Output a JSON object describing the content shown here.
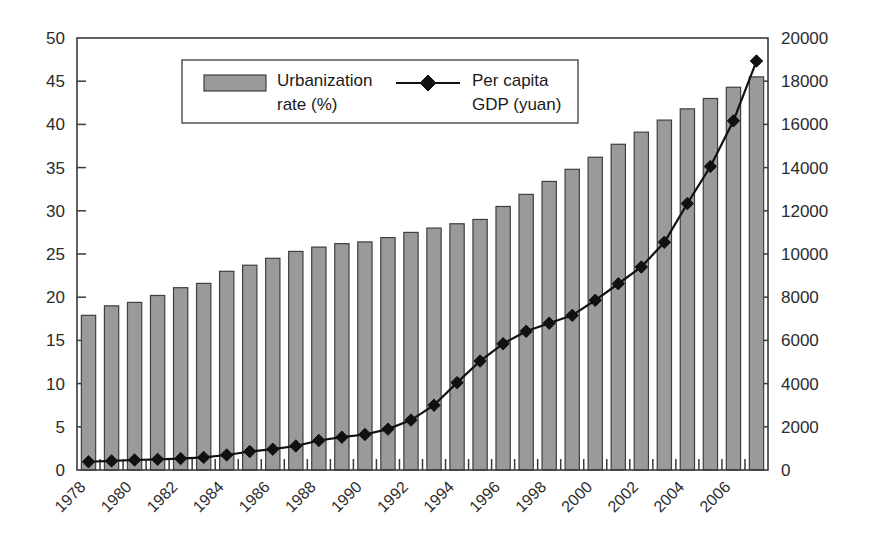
{
  "chart_data": {
    "type": "bar",
    "title": "",
    "subtitle": "",
    "xlabel": "",
    "ylabel": "",
    "grid": false,
    "legend_position": "top-center-inside",
    "categories": [
      "1978",
      "1979",
      "1980",
      "1981",
      "1982",
      "1983",
      "1984",
      "1985",
      "1986",
      "1987",
      "1988",
      "1989",
      "1990",
      "1991",
      "1992",
      "1993",
      "1994",
      "1995",
      "1996",
      "1997",
      "1998",
      "1999",
      "2000",
      "2001",
      "2002",
      "2003",
      "2004",
      "2005",
      "2006",
      "2007"
    ],
    "x_tick_labels": [
      "1978",
      "1980",
      "1982",
      "1984",
      "1986",
      "1988",
      "1990",
      "1992",
      "1994",
      "1996",
      "1998",
      "2000",
      "2002",
      "2004",
      "2006"
    ],
    "x_tick_rotation_degrees": 45,
    "left_axis": {
      "label": "Urbanization rate (%)",
      "ylim": [
        0,
        50
      ],
      "tick_step": 5,
      "ticks": [
        0,
        5,
        10,
        15,
        20,
        25,
        30,
        35,
        40,
        45,
        50
      ]
    },
    "right_axis": {
      "label": "Per capita GDP (yuan)",
      "ylim": [
        0,
        20000
      ],
      "tick_step": 2000,
      "ticks": [
        0,
        2000,
        4000,
        6000,
        8000,
        10000,
        12000,
        14000,
        16000,
        18000,
        20000
      ]
    },
    "series": [
      {
        "name": "Urbanization rate (%)",
        "type": "bar",
        "axis": "left",
        "color": "#9a9a9a",
        "edge_color": "#3f3f3f",
        "values": [
          17.9,
          19.0,
          19.4,
          20.2,
          21.1,
          21.6,
          23.0,
          23.7,
          24.5,
          25.3,
          25.8,
          26.2,
          26.4,
          26.9,
          27.5,
          28.0,
          28.5,
          29.0,
          30.5,
          31.9,
          33.4,
          34.8,
          36.2,
          37.7,
          39.1,
          40.5,
          41.8,
          43.0,
          44.3,
          45.5
        ]
      },
      {
        "name": "Per capita GDP (yuan)",
        "type": "line",
        "axis": "right",
        "color": "#111111",
        "marker": "diamond",
        "values": [
          381,
          419,
          463,
          492,
          528,
          583,
          695,
          858,
          963,
          1112,
          1366,
          1519,
          1644,
          1893,
          2311,
          2998,
          4044,
          5046,
          5846,
          6420,
          6796,
          7159,
          7858,
          8622,
          9398,
          10542,
          12336,
          14053,
          16165,
          18934
        ]
      }
    ]
  },
  "legend": {
    "entries": [
      {
        "label_line1": "Urbanization",
        "label_line2": "rate (%)",
        "symbol": "bar-swatch"
      },
      {
        "label_line1": "Per capita",
        "label_line2": "GDP (yuan)",
        "symbol": "line-diamond"
      }
    ]
  },
  "colors": {
    "bar_fill": "#9a9a9a",
    "bar_edge": "#3f3f3f",
    "line": "#111111",
    "axis": "#3a3a3a",
    "text": "#2b2b2b",
    "background": "#ffffff"
  }
}
